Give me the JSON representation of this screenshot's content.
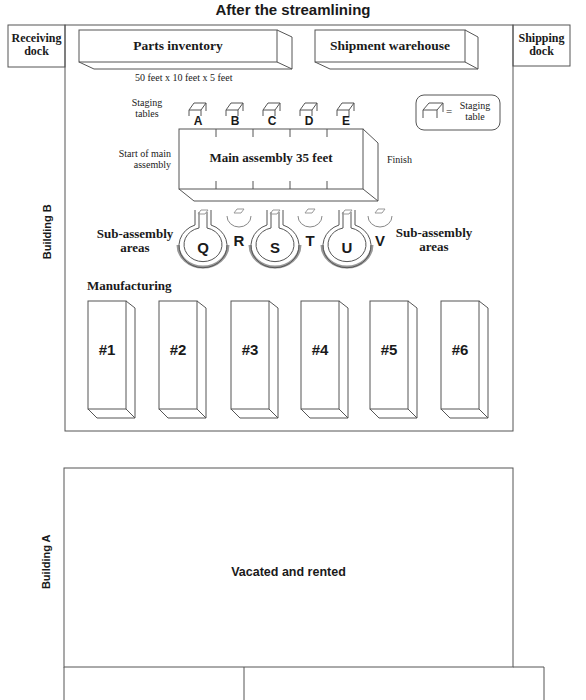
{
  "title": "After the streamlining",
  "building_b": {
    "label": "Building B",
    "receiving_dock": {
      "line1": "Receiving",
      "line2": "dock"
    },
    "shipping_dock": {
      "line1": "Shipping",
      "line2": "dock"
    },
    "parts_inventory": {
      "label": "Parts inventory",
      "dimensions": "50 feet x 10 feet x 5 feet"
    },
    "shipment_warehouse": {
      "label": "Shipment warehouse"
    },
    "staging_tables": {
      "label_line1": "Staging",
      "label_line2": "tables",
      "letters": [
        "A",
        "B",
        "C",
        "D",
        "E"
      ]
    },
    "legend": {
      "line1": "Staging",
      "line2": "table",
      "equals": "="
    },
    "main_assembly": {
      "label": "Main assembly 35 feet",
      "start_line1": "Start of main",
      "start_line2": "assembly",
      "finish": "Finish"
    },
    "sub_assembly": {
      "left_line1": "Sub-assembly",
      "left_line2": "areas",
      "right_line1": "Sub-assembly",
      "right_line2": "areas",
      "large_areas": [
        "Q",
        "S",
        "U"
      ],
      "small_areas": [
        "R",
        "T",
        "V"
      ]
    },
    "manufacturing": {
      "label": "Manufacturing",
      "machines": [
        "#1",
        "#2",
        "#3",
        "#4",
        "#5",
        "#6"
      ]
    }
  },
  "building_a": {
    "label": "Building A",
    "area_label": "Vacated and rented"
  },
  "colors": {
    "line": "#555555",
    "text": "#1a1a1a",
    "shadow": "#9a9a9a"
  }
}
